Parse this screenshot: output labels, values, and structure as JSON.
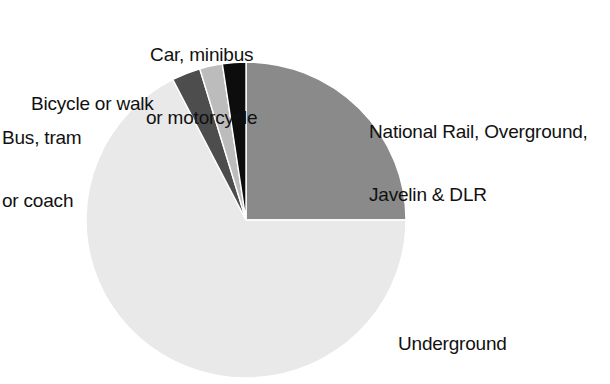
{
  "chart_data": {
    "type": "pie",
    "title": "",
    "subtitle": "",
    "xlabel": "",
    "ylabel": "",
    "legend_position": "none",
    "grid": false,
    "labels_inline": true,
    "start_angle_deg": 0,
    "direction": "clockwise",
    "categories": [
      "National Rail, Overground, Javelin & DLR",
      "Underground",
      "Bus, tram or coach",
      "Bicycle or walk",
      "Car, minibus or motorcycle"
    ],
    "values": [
      25.0,
      67.2,
      2.9,
      2.3,
      2.6
    ],
    "units": "percent",
    "slices": [
      {
        "key": "rail",
        "label_line1": "National Rail, Overground,",
        "label_line2": "Javelin & DLR",
        "value": 25.0,
        "start_deg": 0,
        "end_deg": 90,
        "color": "#8a8a8a"
      },
      {
        "key": "underground",
        "label_line1": "Underground",
        "label_line2": "",
        "value": 67.2,
        "start_deg": 90,
        "end_deg": 332.8,
        "color": "#e9e9e9"
      },
      {
        "key": "bus",
        "label_line1": "Bus, tram",
        "label_line2": "or coach",
        "value": 2.9,
        "start_deg": 332.8,
        "end_deg": 343.2,
        "color": "#4d4d4d"
      },
      {
        "key": "bicycle",
        "label_line1": "Bicycle or walk",
        "label_line2": "",
        "value": 2.3,
        "start_deg": 343.2,
        "end_deg": 351.5,
        "color": "#bcbcbc"
      },
      {
        "key": "car",
        "label_line1": "Car, minibus",
        "label_line2": "or motorcycle",
        "value": 2.6,
        "start_deg": 351.5,
        "end_deg": 360,
        "color": "#0d0d0d"
      }
    ],
    "geometry": {
      "center_x": 246,
      "center_y": 220,
      "radius_x": 160,
      "radius_y": 158
    }
  },
  "labels": {
    "car": {
      "line1": "Car, minibus",
      "line2": "or motorcycle"
    },
    "bicycle": {
      "line1": "Bicycle or walk",
      "line2": ""
    },
    "bus": {
      "line1": "Bus, tram",
      "line2": "or coach"
    },
    "rail": {
      "line1": "National Rail, Overground,",
      "line2": "Javelin & DLR"
    },
    "underground": {
      "line1": "Underground",
      "line2": ""
    }
  },
  "colors": {
    "background": "#ffffff",
    "text": "#111111",
    "rail": "#8a8a8a",
    "underground": "#e9e9e9",
    "bus": "#4d4d4d",
    "bicycle": "#bcbcbc",
    "car": "#0d0d0d",
    "slice_outline": "#ffffff"
  }
}
